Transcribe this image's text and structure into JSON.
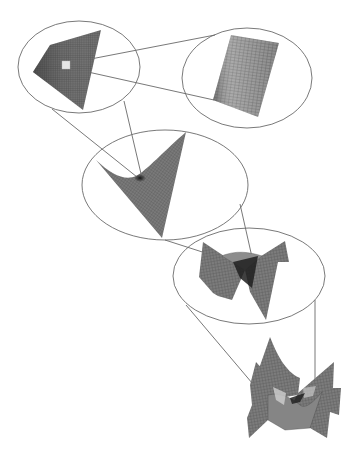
{
  "diagram": {
    "type": "zoom-sequence",
    "colors": {
      "background": "#ffffff",
      "ellipse_stroke": "#6a6a6a",
      "connector_stroke": "#555555",
      "mesh_fill_dark": "#3a3a3a",
      "mesh_fill_mid": "#6e6e6e",
      "mesh_fill_light": "#9a9a9a",
      "highlight_square": "#e6e6e6"
    },
    "stages": [
      {
        "id": "stage-1",
        "label": "",
        "ellipse": {
          "cx": 79,
          "cy": 67,
          "rx": 61,
          "ry": 46
        },
        "surface": "flat quadrilateral mesh patch",
        "highlight": {
          "x": 62,
          "y": 61,
          "w": 8,
          "h": 8
        }
      },
      {
        "id": "stage-2",
        "label": "",
        "ellipse": {
          "cx": 247,
          "cy": 78,
          "rx": 65,
          "ry": 50
        },
        "surface": "magnified planar grid"
      },
      {
        "id": "stage-3",
        "label": "",
        "ellipse": {
          "cx": 165,
          "cy": 185,
          "rx": 83,
          "ry": 55
        },
        "surface": "triangular sheet with curled fold"
      },
      {
        "id": "stage-4",
        "label": "",
        "ellipse": {
          "cx": 249,
          "cy": 276,
          "rx": 76,
          "ry": 48
        },
        "surface": "saddle-like folded surface with dark valley"
      },
      {
        "id": "stage-5",
        "label": "",
        "ellipse": null,
        "surface": "complex multi-fold wavy surface"
      }
    ],
    "connectors": [
      {
        "from": "stage-1",
        "to": "stage-2",
        "lines": [
          [
            70,
            63,
            215,
            35
          ],
          [
            70,
            68,
            214,
            100
          ]
        ]
      },
      {
        "from": "stage-1",
        "to": "stage-3",
        "lines": [
          [
            52,
            109,
            137,
            177
          ],
          [
            124,
            101,
            142,
            178
          ]
        ]
      },
      {
        "from": "stage-3",
        "to": "stage-4",
        "lines": [
          [
            165,
            240,
            246,
            266
          ],
          [
            240,
            204,
            254,
            266
          ]
        ]
      },
      {
        "from": "stage-4",
        "to": "stage-5",
        "lines": [
          [
            186,
            305,
            258,
            390
          ],
          [
            315,
            300,
            315,
            384
          ]
        ]
      }
    ]
  }
}
